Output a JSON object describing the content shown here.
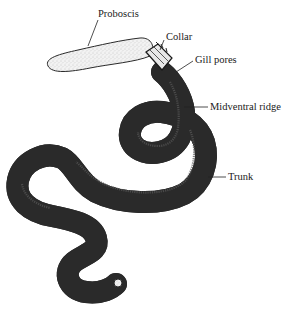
{
  "diagram": {
    "labels": [
      {
        "id": "proboscis",
        "text": "Proboscis"
      },
      {
        "id": "collar",
        "text": "Collar"
      },
      {
        "id": "gill_pores",
        "text": "Gill pores"
      },
      {
        "id": "midventral_ridge",
        "text": "Midventral ridge"
      },
      {
        "id": "trunk",
        "text": "Trunk"
      }
    ]
  }
}
